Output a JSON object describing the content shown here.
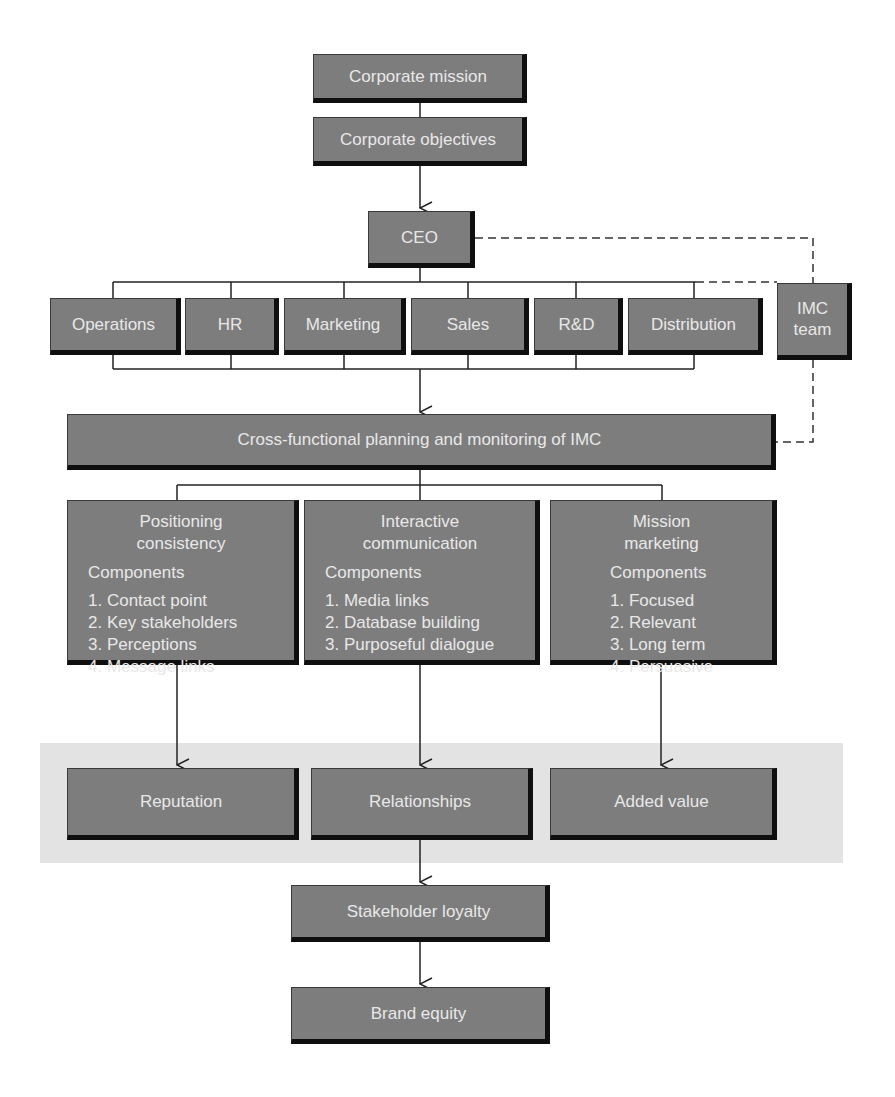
{
  "diagram": {
    "colors": {
      "box_fill": "#7d7d7d",
      "box_shadow": "#0f0f0f",
      "box_text": "#e8e8e8",
      "band_fill": "#e3e3e3",
      "connector": "#222222"
    },
    "top": {
      "corporate_mission": "Corporate mission",
      "corporate_objectives": "Corporate objectives",
      "ceo": "CEO"
    },
    "departments": [
      "Operations",
      "HR",
      "Marketing",
      "Sales",
      "R&D",
      "Distribution"
    ],
    "imc_team": {
      "line1": "IMC",
      "line2": "team"
    },
    "cross_functional": "Cross-functional planning and monitoring of IMC",
    "pillars": [
      {
        "title_line1": "Positioning",
        "title_line2": "consistency",
        "components_label": "Components",
        "items": [
          "1. Contact point",
          "2. Key stakeholders",
          "3. Perceptions",
          "4. Message links"
        ]
      },
      {
        "title_line1": "Interactive",
        "title_line2": "communication",
        "components_label": "Components",
        "items": [
          "1. Media links",
          "2. Database building",
          "3. Purposeful dialogue"
        ]
      },
      {
        "title_line1": "Mission",
        "title_line2": "marketing",
        "components_label": "Components",
        "items": [
          "1. Focused",
          "2. Relevant",
          "3. Long term",
          "4. Persuasive"
        ]
      }
    ],
    "outcomes": [
      "Reputation",
      "Relationships",
      "Added value"
    ],
    "stakeholder_loyalty": "Stakeholder loyalty",
    "brand_equity": "Brand equity"
  }
}
